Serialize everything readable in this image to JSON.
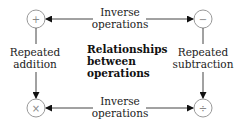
{
  "title": {
    "lines": [
      "Relationships",
      "between",
      "operations"
    ]
  },
  "nodes": {
    "add": {
      "symbol": "+",
      "icon": "plus-icon"
    },
    "subtract": {
      "symbol": "−",
      "icon": "minus-icon"
    },
    "multiply": {
      "symbol": "×",
      "icon": "times-icon"
    },
    "divide": {
      "symbol": "÷",
      "icon": "divide-icon"
    }
  },
  "edges": {
    "top": {
      "lines": [
        "Inverse",
        "operations"
      ]
    },
    "bottom": {
      "lines": [
        "Inverse",
        "operations"
      ]
    },
    "left": {
      "lines": [
        "Repeated",
        "addition"
      ]
    },
    "right": {
      "lines": [
        "Repeated",
        "subtraction"
      ]
    }
  },
  "colors": {
    "line": "#444444",
    "circle": "#999999",
    "text": "#222222"
  }
}
